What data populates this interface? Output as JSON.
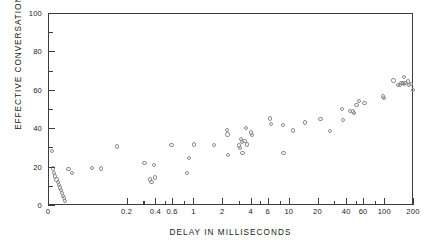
{
  "chart_data": {
    "type": "scatter",
    "title": "",
    "xlabel": "DELAY IN MILLISECONDS",
    "ylabel": "EFFECTIVE CONVERSATIONS",
    "xscale": "log",
    "yscale": "linear",
    "xlim": [
      0.03,
      200
    ],
    "ylim": [
      0,
      100
    ],
    "grid": false,
    "legend": null,
    "marker": "open-circle",
    "marker_color": "#8c8c8c",
    "frame_color": "#3c3c3c",
    "x_major_ticks": [
      0.2,
      0.4,
      0.6,
      1,
      2,
      4,
      6,
      10,
      20,
      40,
      60,
      100,
      200
    ],
    "x_major_tick_labels": [
      "0.2",
      "0.4",
      "0.6",
      "1",
      "2",
      "4",
      "6",
      "10",
      "20",
      "40",
      "60",
      "100",
      "200"
    ],
    "x_origin_label": "0",
    "x_minor_ticks": [
      0.3,
      0.5,
      0.8,
      3,
      5,
      8,
      30,
      50,
      80
    ],
    "y_major_ticks": [
      0,
      20,
      40,
      60,
      80,
      100
    ],
    "y_major_tick_labels": [
      "0",
      "20",
      "40",
      "60",
      "80",
      "100"
    ],
    "y_minor_ticks": [
      10,
      30,
      50,
      70,
      90
    ],
    "points": [
      {
        "x": 0.032,
        "y": 28.6
      },
      {
        "x": 0.033,
        "y": 19.5
      },
      {
        "x": 0.034,
        "y": 17.0
      },
      {
        "x": 0.035,
        "y": 15.4
      },
      {
        "x": 0.036,
        "y": 13.8
      },
      {
        "x": 0.037,
        "y": 12.4
      },
      {
        "x": 0.038,
        "y": 11.0
      },
      {
        "x": 0.039,
        "y": 9.6
      },
      {
        "x": 0.04,
        "y": 8.2
      },
      {
        "x": 0.041,
        "y": 6.8
      },
      {
        "x": 0.042,
        "y": 5.4
      },
      {
        "x": 0.043,
        "y": 4.0
      },
      {
        "x": 0.044,
        "y": 2.8
      },
      {
        "x": 0.048,
        "y": 19.3
      },
      {
        "x": 0.052,
        "y": 17.2
      },
      {
        "x": 0.085,
        "y": 19.6
      },
      {
        "x": 0.105,
        "y": 19.5
      },
      {
        "x": 0.155,
        "y": 31.0
      },
      {
        "x": 0.3,
        "y": 22.2
      },
      {
        "x": 0.345,
        "y": 13.8
      },
      {
        "x": 0.355,
        "y": 12.4
      },
      {
        "x": 0.375,
        "y": 21.3
      },
      {
        "x": 0.385,
        "y": 14.8
      },
      {
        "x": 0.575,
        "y": 31.9
      },
      {
        "x": 0.84,
        "y": 17.3
      },
      {
        "x": 0.88,
        "y": 25.0
      },
      {
        "x": 1.0,
        "y": 32.0
      },
      {
        "x": 1.62,
        "y": 31.7
      },
      {
        "x": 2.2,
        "y": 39.6
      },
      {
        "x": 2.22,
        "y": 37.2
      },
      {
        "x": 2.25,
        "y": 26.4
      },
      {
        "x": 2.95,
        "y": 31.5
      },
      {
        "x": 3.0,
        "y": 30.2
      },
      {
        "x": 3.1,
        "y": 34.7
      },
      {
        "x": 3.15,
        "y": 33.5
      },
      {
        "x": 3.2,
        "y": 27.4
      },
      {
        "x": 3.35,
        "y": 33.7
      },
      {
        "x": 3.5,
        "y": 40.7
      },
      {
        "x": 3.55,
        "y": 32.0
      },
      {
        "x": 3.95,
        "y": 38.3
      },
      {
        "x": 4.05,
        "y": 37.0
      },
      {
        "x": 6.2,
        "y": 45.6
      },
      {
        "x": 6.4,
        "y": 42.6
      },
      {
        "x": 8.5,
        "y": 42.0
      },
      {
        "x": 8.6,
        "y": 27.6
      },
      {
        "x": 10.8,
        "y": 39.3
      },
      {
        "x": 14.3,
        "y": 43.5
      },
      {
        "x": 21.0,
        "y": 45.3
      },
      {
        "x": 26.5,
        "y": 39.0
      },
      {
        "x": 35.5,
        "y": 50.5
      },
      {
        "x": 36.0,
        "y": 44.8
      },
      {
        "x": 42.5,
        "y": 49.4
      },
      {
        "x": 46.0,
        "y": 49.2
      },
      {
        "x": 47.5,
        "y": 48.6
      },
      {
        "x": 50.0,
        "y": 52.6
      },
      {
        "x": 53.5,
        "y": 54.6
      },
      {
        "x": 60.5,
        "y": 53.6
      },
      {
        "x": 95.0,
        "y": 57.0
      },
      {
        "x": 97.0,
        "y": 56.1
      },
      {
        "x": 122.0,
        "y": 65.4
      },
      {
        "x": 136.0,
        "y": 63.0
      },
      {
        "x": 143.0,
        "y": 62.9
      },
      {
        "x": 148.0,
        "y": 63.9
      },
      {
        "x": 152.0,
        "y": 64.0
      },
      {
        "x": 156.0,
        "y": 67.0
      },
      {
        "x": 158.0,
        "y": 63.4
      },
      {
        "x": 163.0,
        "y": 64.0
      },
      {
        "x": 172.0,
        "y": 64.8
      },
      {
        "x": 178.0,
        "y": 63.2
      },
      {
        "x": 185.0,
        "y": 63.4
      },
      {
        "x": 196.0,
        "y": 60.6
      }
    ]
  }
}
